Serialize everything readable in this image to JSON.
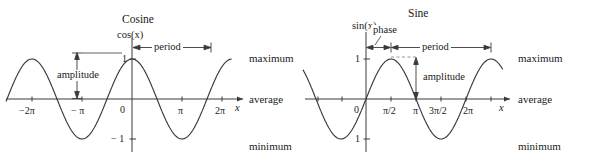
{
  "figure": {
    "panels": [
      {
        "id": "cosine",
        "title": "Cosine",
        "y_axis_label": "cos(x)",
        "x_axis_label": "x",
        "x_ticks": [
          "−2π",
          "− π",
          "0",
          "π",
          "2π"
        ],
        "y_ticks": [
          "1",
          "− 1"
        ],
        "annotations": {
          "period": "period",
          "amplitude": "amplitude"
        },
        "level_labels": {
          "maximum": "maximum",
          "average": "average",
          "minimum": "minimum"
        }
      },
      {
        "id": "sine",
        "title": "Sine",
        "y_axis_label": "sin(x)",
        "x_axis_label": "x",
        "x_ticks": [
          "0",
          "π/2",
          "π",
          "3π/2",
          "2π"
        ],
        "y_ticks": [
          "1",
          "1"
        ],
        "annotations": {
          "phase": "phase",
          "period": "period",
          "amplitude": "amplitude"
        },
        "level_labels": {
          "maximum": "maximum",
          "average": "average",
          "minimum": "minimum"
        }
      }
    ]
  },
  "chart_data": [
    {
      "type": "line",
      "title": "Cosine",
      "xlabel": "x",
      "ylabel": "cos(x)",
      "function": "y = cos(x)",
      "xlim": [
        -7.85,
        7.85
      ],
      "ylim": [
        -1.45,
        1.45
      ],
      "grid": false,
      "legend": null,
      "x_tick_values": [
        -6.283,
        -3.142,
        0,
        3.142,
        6.283
      ],
      "x_tick_labels": [
        "−2π",
        "− π",
        "0",
        "π",
        "2π"
      ],
      "y_tick_values": [
        1,
        -1
      ],
      "y_tick_labels": [
        "1",
        "− 1"
      ],
      "annotations": [
        {
          "text": "period",
          "type": "double-arrow",
          "from_x": 0,
          "to_x": 6.283,
          "at_y": 1.28
        },
        {
          "text": "amplitude",
          "type": "double-arrow",
          "at_x": -4.45,
          "from_y": 1.0,
          "to_y": 0.0
        },
        {
          "text": "maximum",
          "type": "level-label",
          "at_y": 1.0
        },
        {
          "text": "average",
          "type": "level-label",
          "at_y": 0.0
        },
        {
          "text": "minimum",
          "type": "level-label",
          "at_y": -1.0
        }
      ]
    },
    {
      "type": "line",
      "title": "Sine",
      "xlabel": "x",
      "ylabel": "sin(x)",
      "function": "y = sin(x)",
      "xlim": [
        -4.4,
        10.6
      ],
      "ylim": [
        -1.45,
        1.45
      ],
      "grid": false,
      "legend": null,
      "x_tick_values": [
        0,
        1.571,
        3.142,
        4.712,
        6.283
      ],
      "x_tick_labels": [
        "0",
        "π/2",
        "π",
        "3π/2",
        "2π"
      ],
      "y_tick_values": [
        1,
        -1
      ],
      "y_tick_labels": [
        "1",
        "1"
      ],
      "annotations": [
        {
          "text": "phase",
          "type": "arrow",
          "from_x": 0,
          "to_x": 1.571,
          "at_y": 1.28
        },
        {
          "text": "period",
          "type": "double-arrow",
          "from_x": 1.571,
          "to_x": 7.854,
          "at_y": 1.28
        },
        {
          "text": "amplitude",
          "type": "double-arrow",
          "at_x": 3.93,
          "from_y": 1.0,
          "to_y": 0.0
        },
        {
          "text": "maximum",
          "type": "level-label",
          "at_y": 1.0
        },
        {
          "text": "average",
          "type": "level-label",
          "at_y": 0.0
        },
        {
          "text": "minimum",
          "type": "level-label",
          "at_y": -1.0
        }
      ]
    }
  ]
}
